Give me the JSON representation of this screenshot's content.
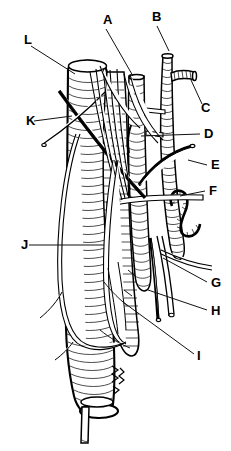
{
  "figure": {
    "style": "black and white ink line art, no color",
    "background_color": "#ffffff",
    "ink_color": "#000000",
    "width": 231,
    "height": 451,
    "signature": "artist signature"
  },
  "labels": [
    {
      "id": "A",
      "text": "A",
      "x": 103,
      "y": 24,
      "leader": {
        "x1": 106,
        "y1": 29,
        "x2": 133,
        "y2": 76
      }
    },
    {
      "id": "B",
      "text": "B",
      "x": 152,
      "y": 21,
      "leader": {
        "x1": 157,
        "y1": 26,
        "x2": 169,
        "y2": 51
      }
    },
    {
      "id": "C",
      "text": "C",
      "x": 201,
      "y": 112,
      "leader": {
        "x1": 202,
        "y1": 104,
        "x2": 191,
        "y2": 80
      }
    },
    {
      "id": "D",
      "text": "D",
      "x": 204,
      "y": 138,
      "leader": {
        "x1": 200,
        "y1": 134,
        "x2": 141,
        "y2": 136
      }
    },
    {
      "id": "E",
      "text": "E",
      "x": 211,
      "y": 169,
      "leader": {
        "x1": 207,
        "y1": 165,
        "x2": 188,
        "y2": 160
      }
    },
    {
      "id": "F",
      "text": "F",
      "x": 209,
      "y": 195,
      "leader": {
        "x1": 205,
        "y1": 191,
        "x2": 180,
        "y2": 196
      }
    },
    {
      "id": "G",
      "text": "G",
      "x": 211,
      "y": 287,
      "leader": {
        "x1": 207,
        "y1": 282,
        "x2": 163,
        "y2": 258
      }
    },
    {
      "id": "H",
      "text": "H",
      "x": 211,
      "y": 315,
      "leader": {
        "x1": 207,
        "y1": 310,
        "x2": 148,
        "y2": 290
      }
    },
    {
      "id": "I",
      "text": "I",
      "x": 197,
      "y": 360,
      "leader": {
        "x1": 194,
        "y1": 354,
        "x2": 123,
        "y2": 302
      }
    },
    {
      "id": "J",
      "text": "J",
      "x": 21,
      "y": 249,
      "leader": {
        "x1": 29,
        "y1": 245,
        "x2": 104,
        "y2": 245
      }
    },
    {
      "id": "K",
      "text": "K",
      "x": 26,
      "y": 125,
      "leader": {
        "x1": 34,
        "y1": 121,
        "x2": 72,
        "y2": 116
      }
    },
    {
      "id": "L",
      "text": "L",
      "x": 24,
      "y": 44,
      "leader": {
        "x1": 31,
        "y1": 46,
        "x2": 75,
        "y2": 74
      }
    }
  ]
}
